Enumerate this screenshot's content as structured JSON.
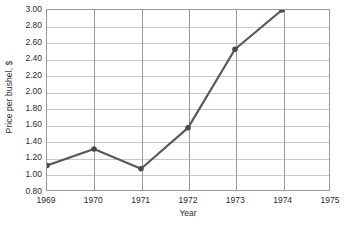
{
  "chart_data": {
    "type": "line",
    "title": "",
    "xlabel": "Year",
    "ylabel": "Price per bushel, $",
    "x": [
      1969,
      1970,
      1971,
      1972,
      1973,
      1974
    ],
    "values": [
      1.1,
      1.3,
      1.06,
      1.56,
      2.52,
      3.0
    ],
    "series": [
      {
        "name": "Price per bushel",
        "values": [
          1.1,
          1.3,
          1.06,
          1.56,
          2.52,
          3.0
        ]
      }
    ],
    "xlim": [
      1969,
      1975
    ],
    "ylim": [
      0.8,
      3.0
    ],
    "xticks": [
      1969,
      1970,
      1971,
      1972,
      1973,
      1974,
      1975
    ],
    "xtick_labels": [
      "1969",
      "1970",
      "1971",
      "1972",
      "1973",
      "1974",
      "1975"
    ],
    "yticks": [
      0.8,
      1.0,
      1.2,
      1.4,
      1.6,
      1.8,
      2.0,
      2.2,
      2.4,
      2.6,
      2.8,
      3.0
    ],
    "ytick_labels": [
      "0.80",
      "1.00",
      "1.20",
      "1.40",
      "1.60",
      "1.80",
      "2.00",
      "2.20",
      "2.40",
      "2.60",
      "2.80",
      "3.00"
    ],
    "grid": "both",
    "legend": "none",
    "line_color": "#595959",
    "marker_color": "#4a4a4a",
    "marker": "circle",
    "axis_color": "#9a9a9a",
    "gridline_color": "#c9c9c9",
    "text_color": "#2b2b2b",
    "background_color": "#ffffff"
  }
}
